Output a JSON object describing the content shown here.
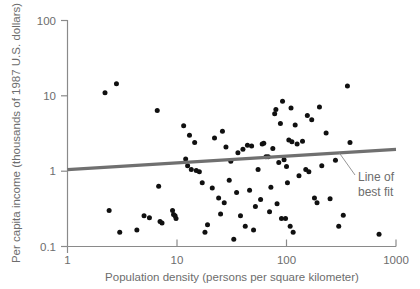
{
  "chart_data": {
    "type": "scatter",
    "title": "",
    "xlabel": "Population density (persons per square kilometer)",
    "ylabel": "Per capita income (thousands of 1987 U.S. dollars)",
    "xscale": "log",
    "yscale": "log",
    "xlim": [
      1,
      1000
    ],
    "ylim": [
      0.1,
      100
    ],
    "xticks": [
      1,
      10,
      100,
      1000
    ],
    "xtick_labels": [
      "1",
      "10",
      "100",
      "1000"
    ],
    "yticks": [
      0.1,
      1,
      10,
      100
    ],
    "ytick_labels": [
      "0.1",
      "1",
      "10",
      "100"
    ],
    "grid": false,
    "legend": "none",
    "annotations": [
      {
        "name": "line-of-best-fit",
        "text_line1": "Line of",
        "text_line2": "best fit",
        "points_to_x": 300,
        "points_to_y": 2.0
      }
    ],
    "series": [
      {
        "name": "countries",
        "marker": "filled-circle",
        "color": "#101010",
        "points": [
          [
            2.2,
            11.0
          ],
          [
            2.8,
            14.5
          ],
          [
            2.4,
            0.3
          ],
          [
            3.0,
            0.155
          ],
          [
            4.3,
            0.165
          ],
          [
            5.0,
            0.255
          ],
          [
            5.6,
            0.24
          ],
          [
            6.6,
            6.4
          ],
          [
            6.8,
            0.63
          ],
          [
            7.0,
            0.215
          ],
          [
            7.3,
            0.205
          ],
          [
            9.1,
            0.3
          ],
          [
            9.3,
            0.265
          ],
          [
            9.6,
            0.255
          ],
          [
            9.8,
            0.235
          ],
          [
            11.5,
            4.0
          ],
          [
            12.0,
            1.45
          ],
          [
            12.5,
            1.18
          ],
          [
            13.0,
            3.0
          ],
          [
            13.5,
            1.05
          ],
          [
            14.5,
            2.4
          ],
          [
            15.0,
            1.02
          ],
          [
            16.0,
            0.98
          ],
          [
            17.0,
            0.7
          ],
          [
            18.0,
            0.155
          ],
          [
            19.0,
            0.195
          ],
          [
            21.0,
            0.6
          ],
          [
            22.0,
            2.75
          ],
          [
            24.0,
            0.44
          ],
          [
            25.0,
            0.27
          ],
          [
            26.0,
            3.4
          ],
          [
            27.0,
            0.38
          ],
          [
            28.0,
            2.1
          ],
          [
            30.0,
            0.76
          ],
          [
            31.0,
            1.35
          ],
          [
            33.0,
            0.125
          ],
          [
            35.0,
            0.52
          ],
          [
            36.0,
            1.75
          ],
          [
            38.0,
            0.255
          ],
          [
            40.0,
            1.95
          ],
          [
            42.0,
            0.185
          ],
          [
            44.0,
            2.2
          ],
          [
            46.0,
            0.56
          ],
          [
            48.0,
            2.15
          ],
          [
            50.0,
            0.165
          ],
          [
            52.0,
            0.34
          ],
          [
            55.0,
            1.05
          ],
          [
            58.0,
            0.42
          ],
          [
            60.0,
            2.3
          ],
          [
            62.0,
            2.35
          ],
          [
            65.0,
            1.55
          ],
          [
            68.0,
            1.55
          ],
          [
            70.0,
            0.29
          ],
          [
            72.0,
            0.61
          ],
          [
            75.0,
            2.0
          ],
          [
            78.0,
            5.8
          ],
          [
            80.0,
            6.6
          ],
          [
            82.0,
            0.37
          ],
          [
            85.0,
            1.3
          ],
          [
            88.0,
            4.3
          ],
          [
            90.0,
            0.235
          ],
          [
            92.0,
            8.5
          ],
          [
            95.0,
            1.42
          ],
          [
            98.0,
            0.235
          ],
          [
            100.0,
            1.15
          ],
          [
            102.0,
            0.7
          ],
          [
            105.0,
            2.6
          ],
          [
            108.0,
            0.185
          ],
          [
            110.0,
            6.9
          ],
          [
            112.0,
            2.45
          ],
          [
            115.0,
            0.155
          ],
          [
            120.0,
            4.1
          ],
          [
            125.0,
            2.3
          ],
          [
            130.0,
            0.87
          ],
          [
            140.0,
            2.5
          ],
          [
            150.0,
            1.05
          ],
          [
            155.0,
            5.5
          ],
          [
            160.0,
            0.98
          ],
          [
            170.0,
            4.8
          ],
          [
            180.0,
            0.44
          ],
          [
            190.0,
            0.38
          ],
          [
            200.0,
            7.1
          ],
          [
            210.0,
            1.18
          ],
          [
            230.0,
            3.2
          ],
          [
            250.0,
            0.43
          ],
          [
            280.0,
            1.4
          ],
          [
            300.0,
            0.185
          ],
          [
            330.0,
            0.26
          ],
          [
            360.0,
            13.5
          ],
          [
            380.0,
            2.4
          ],
          [
            700.0,
            0.145
          ]
        ]
      }
    ],
    "trend_line": {
      "name": "line-of-best-fit",
      "color": "#707070",
      "x_start": 1,
      "y_start": 1.05,
      "x_end": 1000,
      "y_end": 1.95
    }
  }
}
